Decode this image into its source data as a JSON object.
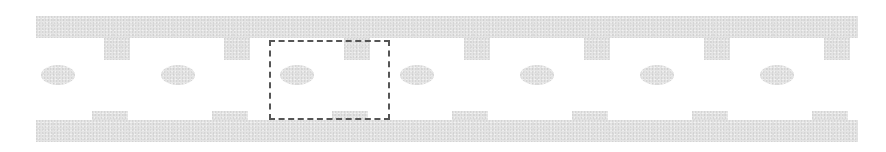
{
  "diagram": {
    "colors": {
      "fill": "#e4e4e4",
      "selection_border": "#555555",
      "background": "#ffffff"
    },
    "top_bar": {
      "x": 36,
      "y": 16,
      "width": 822,
      "height": 22
    },
    "bottom_bar": {
      "x": 36,
      "y": 120,
      "width": 822,
      "height": 22
    },
    "top_tabs": [
      {
        "x": 104,
        "y": 38,
        "width": 26,
        "height": 22
      },
      {
        "x": 224,
        "y": 38,
        "width": 26,
        "height": 22
      },
      {
        "x": 344,
        "y": 38,
        "width": 26,
        "height": 22
      },
      {
        "x": 464,
        "y": 38,
        "width": 26,
        "height": 22
      },
      {
        "x": 584,
        "y": 38,
        "width": 26,
        "height": 22
      },
      {
        "x": 704,
        "y": 38,
        "width": 26,
        "height": 22
      },
      {
        "x": 824,
        "y": 38,
        "width": 26,
        "height": 22
      }
    ],
    "bottom_tabs": [
      {
        "x": 92,
        "y": 111,
        "width": 36,
        "height": 9
      },
      {
        "x": 212,
        "y": 111,
        "width": 36,
        "height": 9
      },
      {
        "x": 332,
        "y": 111,
        "width": 36,
        "height": 9
      },
      {
        "x": 452,
        "y": 111,
        "width": 36,
        "height": 9
      },
      {
        "x": 572,
        "y": 111,
        "width": 36,
        "height": 9
      },
      {
        "x": 692,
        "y": 111,
        "width": 36,
        "height": 9
      },
      {
        "x": 812,
        "y": 111,
        "width": 36,
        "height": 9
      }
    ],
    "ellipses": [
      {
        "cx": 58,
        "cy": 75,
        "rx": 17,
        "ry": 10
      },
      {
        "cx": 178,
        "cy": 75,
        "rx": 17,
        "ry": 10
      },
      {
        "cx": 297,
        "cy": 75,
        "rx": 17,
        "ry": 10
      },
      {
        "cx": 417,
        "cy": 75,
        "rx": 17,
        "ry": 10
      },
      {
        "cx": 537,
        "cy": 75,
        "rx": 17,
        "ry": 10
      },
      {
        "cx": 657,
        "cy": 75,
        "rx": 17,
        "ry": 10
      },
      {
        "cx": 777,
        "cy": 75,
        "rx": 17,
        "ry": 10
      }
    ],
    "selection": {
      "x": 269,
      "y": 40,
      "width": 121,
      "height": 80
    }
  }
}
